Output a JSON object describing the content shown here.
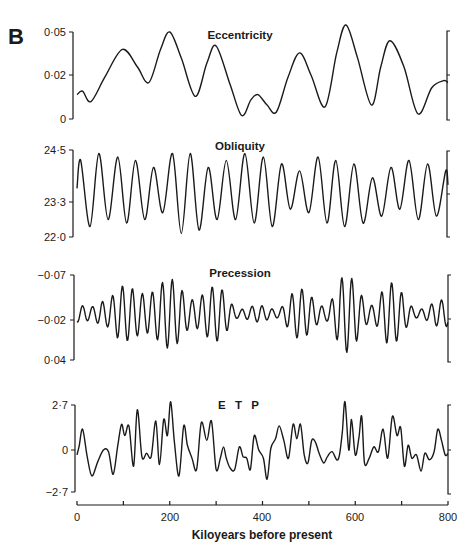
{
  "figure": {
    "panel_letter": "B",
    "x_axis": {
      "label": "Kiloyears before present",
      "ticks": [
        "0",
        "200",
        "400",
        "600",
        "800"
      ],
      "minor_ticks": [
        100,
        300,
        500,
        700
      ],
      "range": [
        0,
        800
      ]
    }
  },
  "chart_data": [
    {
      "type": "line",
      "title": "Eccentricity",
      "xlabel": "Kiloyears before present",
      "ylabel": "",
      "yticks": [
        "0·05",
        "0·02",
        "0"
      ],
      "ytick_values": [
        0.05,
        0.02,
        0
      ],
      "ylim": [
        0,
        0.05
      ],
      "inverted": false,
      "x": [
        0,
        12,
        30,
        60,
        98,
        130,
        155,
        180,
        200,
        225,
        255,
        280,
        300,
        330,
        355,
        375,
        390,
        410,
        430,
        455,
        480,
        505,
        535,
        560,
        580,
        605,
        635,
        655,
        675,
        705,
        735,
        765,
        790,
        800
      ],
      "values": [
        0.014,
        0.016,
        0.01,
        0.024,
        0.04,
        0.03,
        0.021,
        0.04,
        0.05,
        0.035,
        0.013,
        0.032,
        0.042,
        0.02,
        0.002,
        0.011,
        0.014,
        0.008,
        0.004,
        0.024,
        0.038,
        0.025,
        0.007,
        0.038,
        0.054,
        0.035,
        0.008,
        0.03,
        0.045,
        0.03,
        0.003,
        0.018,
        0.022,
        0.021
      ]
    },
    {
      "type": "line",
      "title": "Obliquity",
      "xlabel": "Kiloyears before present",
      "ylabel": "",
      "yticks": [
        "24·5",
        "23·3",
        "22·0"
      ],
      "ytick_values": [
        24.5,
        23.3,
        22.0
      ],
      "ylim": [
        22.0,
        24.5
      ],
      "inverted": false,
      "period_ka": 41,
      "peaks_x": [
        8,
        47,
        88,
        126,
        165,
        206,
        244,
        283,
        322,
        362,
        402,
        441,
        480,
        520,
        558,
        597,
        637,
        677,
        716,
        756,
        795
      ],
      "peaks_y": [
        24.2,
        24.4,
        24.3,
        24.2,
        24.0,
        24.4,
        24.4,
        24.0,
        24.2,
        24.4,
        24.3,
        24.1,
        23.9,
        24.3,
        24.2,
        24.1,
        23.7,
        24.0,
        24.2,
        24.1,
        23.9
      ],
      "troughs_x": [
        28,
        67,
        107,
        146,
        185,
        225,
        263,
        302,
        342,
        382,
        421,
        460,
        500,
        539,
        577,
        617,
        657,
        696,
        736,
        775
      ],
      "troughs_y": [
        22.3,
        22.5,
        22.4,
        22.5,
        22.7,
        22.1,
        22.2,
        22.5,
        22.5,
        22.4,
        22.3,
        22.8,
        22.7,
        22.4,
        22.3,
        22.4,
        22.6,
        22.8,
        22.5,
        22.6
      ]
    },
    {
      "type": "line",
      "title": "Precession",
      "xlabel": "Kiloyears before present",
      "ylabel": "",
      "yticks": [
        "−0·07",
        "−0·02",
        "0·04"
      ],
      "ytick_values": [
        -0.07,
        -0.02,
        0.04
      ],
      "ylim": [
        0.04,
        -0.07
      ],
      "inverted": true,
      "period_ka": 21.5,
      "envelope": [
        {
          "x": 0,
          "amp": 0.012
        },
        {
          "x": 30,
          "amp": 0.01
        },
        {
          "x": 60,
          "amp": 0.018
        },
        {
          "x": 100,
          "amp": 0.04
        },
        {
          "x": 150,
          "amp": 0.028
        },
        {
          "x": 200,
          "amp": 0.05
        },
        {
          "x": 250,
          "amp": 0.02
        },
        {
          "x": 300,
          "amp": 0.04
        },
        {
          "x": 350,
          "amp": 0.006
        },
        {
          "x": 390,
          "amp": 0.012
        },
        {
          "x": 430,
          "amp": 0.006
        },
        {
          "x": 480,
          "amp": 0.036
        },
        {
          "x": 535,
          "amp": 0.01
        },
        {
          "x": 580,
          "amp": 0.056
        },
        {
          "x": 635,
          "amp": 0.012
        },
        {
          "x": 675,
          "amp": 0.045
        },
        {
          "x": 735,
          "amp": 0.006
        },
        {
          "x": 790,
          "amp": 0.02
        },
        {
          "x": 800,
          "amp": 0.018
        }
      ]
    },
    {
      "type": "line",
      "title": "E T P",
      "xlabel": "Kiloyears before present",
      "ylabel": "",
      "yticks": [
        "2·7",
        "0",
        "−2·7"
      ],
      "ytick_values": [
        2.7,
        0,
        -2.7
      ],
      "ylim": [
        -2.7,
        2.7
      ],
      "inverted": false,
      "x": [
        0,
        5,
        12,
        22,
        32,
        45,
        57,
        68,
        78,
        88,
        96,
        103,
        112,
        122,
        130,
        140,
        150,
        160,
        170,
        178,
        187,
        195,
        202,
        210,
        220,
        230,
        238,
        248,
        258,
        268,
        280,
        290,
        300,
        309,
        316,
        322,
        330,
        340,
        350,
        358,
        366,
        374,
        382,
        392,
        402,
        410,
        418,
        428,
        436,
        446,
        456,
        466,
        474,
        482,
        490,
        498,
        506,
        514,
        522,
        532,
        540,
        550,
        560,
        566,
        572,
        578,
        586,
        592,
        600,
        608,
        614,
        620,
        630,
        640,
        650,
        660,
        670,
        680,
        690,
        698,
        706,
        714,
        722,
        732,
        742,
        750,
        760,
        770,
        778,
        786,
        794,
        800
      ],
      "values": [
        -0.4,
        0.2,
        1.2,
        -0.5,
        -1.7,
        -0.8,
        -0.1,
        -0.2,
        -1.6,
        0.2,
        1.5,
        0.8,
        1.4,
        -1.1,
        2.4,
        -0.5,
        -0.3,
        -0.5,
        1.7,
        -1.0,
        1.8,
        0.8,
        2.9,
        0.4,
        -1.7,
        1.4,
        0.2,
        -0.6,
        -1.3,
        1.6,
        0.5,
        1.7,
        -1.3,
        -0.6,
        0.1,
        -0.6,
        -1.2,
        -1.3,
        0.1,
        -0.5,
        -0.6,
        -1.3,
        0.8,
        -0.1,
        -0.6,
        -1.9,
        0.0,
        0.6,
        1.4,
        0.5,
        -0.6,
        1.5,
        0.6,
        1.5,
        -0.4,
        -0.9,
        0.5,
        0.4,
        -0.3,
        -0.9,
        -0.5,
        -0.2,
        -0.7,
        -0.4,
        1.0,
        2.9,
        -0.1,
        1.8,
        -0.4,
        0.7,
        2.0,
        -0.9,
        -0.6,
        0.1,
        -0.2,
        1.2,
        -0.6,
        2.0,
        0.8,
        1.3,
        -1.1,
        0.2,
        -0.6,
        -0.4,
        -1.4,
        -0.3,
        -0.7,
        -0.2,
        1.2,
        0.5,
        -0.4,
        -0.3
      ]
    }
  ]
}
